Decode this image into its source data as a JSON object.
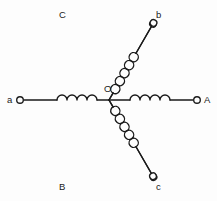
{
  "diagram": {
    "type": "electrical-schematic",
    "background_color": "#fdfdfd",
    "line_color": "#1a1a1a",
    "center": {
      "label": "O",
      "x": 109,
      "y": 100,
      "label_x": 104,
      "label_y": 84
    },
    "branches": [
      {
        "id": "branch-a",
        "label": "a",
        "label_x": 7,
        "label_y": 95,
        "terminal_x": 20,
        "terminal_y": 100,
        "angle_deg": 180,
        "coil_loops": 4,
        "orientation": "horizontal-left"
      },
      {
        "id": "branch-A",
        "label": "A",
        "label_x": 204,
        "label_y": 95,
        "terminal_x": 197,
        "terminal_y": 100,
        "angle_deg": 0,
        "coil_loops": 4,
        "orientation": "horizontal-right"
      },
      {
        "id": "branch-C",
        "label": "C",
        "label_x": 59,
        "label_y": 10,
        "terminal_x": 66,
        "terminal_y": 26,
        "angle_deg": 120,
        "coil_loops": 5,
        "orientation": "diagonal-upper-left"
      },
      {
        "id": "branch-b",
        "label": "b",
        "label_x": 156,
        "label_y": 10,
        "terminal_x": 152,
        "terminal_y": 26,
        "angle_deg": 60,
        "coil_loops": 5,
        "orientation": "diagonal-upper-right"
      },
      {
        "id": "branch-B",
        "label": "B",
        "label_x": 59,
        "label_y": 182,
        "terminal_x": 66,
        "terminal_y": 173,
        "angle_deg": 240,
        "coil_loops": 5,
        "orientation": "diagonal-lower-left"
      },
      {
        "id": "branch-c",
        "label": "c",
        "label_x": 156,
        "label_y": 182,
        "terminal_x": 152,
        "terminal_y": 173,
        "angle_deg": 300,
        "coil_loops": 5,
        "orientation": "diagonal-lower-right"
      }
    ]
  }
}
